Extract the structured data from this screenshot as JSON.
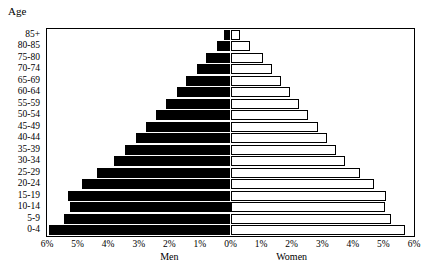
{
  "chart_data": {
    "type": "bar",
    "subtype": "population-pyramid",
    "title": "",
    "axis_caption": "Age",
    "xlabel": "",
    "ylabel": "Age",
    "grid": false,
    "legend": "none",
    "orientation": "horizontal",
    "xlim": [
      -6,
      6
    ],
    "xtick_labels": [
      "6%",
      "5%",
      "4%",
      "3%",
      "2%",
      "1%",
      "0%",
      "1%",
      "2%",
      "3%",
      "4%",
      "5%",
      "6%"
    ],
    "xtick_values": [
      -6,
      -5,
      -4,
      -3,
      -2,
      -1,
      0,
      1,
      2,
      3,
      4,
      5,
      6
    ],
    "categories": [
      "0-4",
      "5-9",
      "10-14",
      "15-19",
      "20-24",
      "25-29",
      "30-34",
      "35-39",
      "40-44",
      "45-49",
      "50-54",
      "55-59",
      "60-64",
      "65-69",
      "70-74",
      "75-80",
      "80-85",
      "85+"
    ],
    "series": [
      {
        "name": "Men",
        "side": "left",
        "color": "#000000",
        "values": [
          5.95,
          5.45,
          5.25,
          5.3,
          4.85,
          4.35,
          3.8,
          3.45,
          3.1,
          2.75,
          2.45,
          2.1,
          1.75,
          1.45,
          1.1,
          0.8,
          0.45,
          0.2
        ]
      },
      {
        "name": "Women",
        "side": "right",
        "color": "#ffffff",
        "values": [
          5.7,
          5.25,
          5.05,
          5.1,
          4.7,
          4.25,
          3.75,
          3.45,
          3.15,
          2.85,
          2.55,
          2.25,
          1.95,
          1.65,
          1.35,
          1.05,
          0.65,
          0.3
        ]
      }
    ]
  },
  "captions": {
    "age": "Age",
    "men": "Men",
    "women": "Women"
  }
}
